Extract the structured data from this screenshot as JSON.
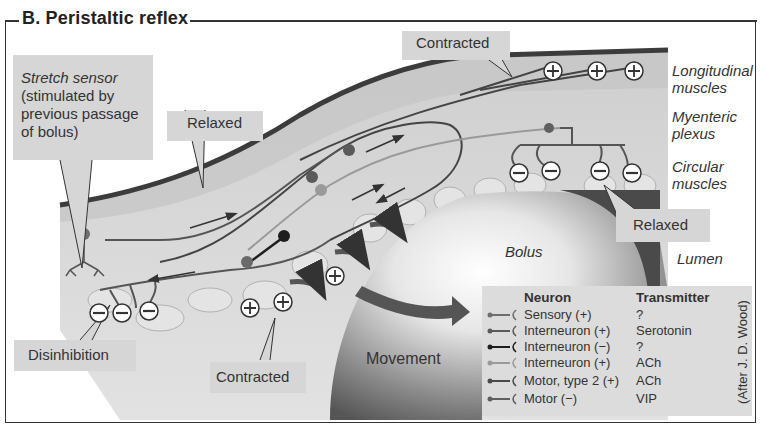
{
  "figure": {
    "title": "B.  Peristaltic reflex",
    "credit": "(After J. D. Wood)"
  },
  "callouts": {
    "stretch_sensor": {
      "line1": "Stretch sensor",
      "line2": "(stimulated by",
      "line3": "previous passage",
      "line4": "of bolus)"
    },
    "relaxed_top": "Relaxed",
    "contracted_top": "Contracted",
    "relaxed_right": "Relaxed",
    "disinhibition": "Disinhibition",
    "contracted_bottom": "Contracted"
  },
  "layers": {
    "longitudinal_1": "Longitudinal",
    "longitudinal_2": "muscles",
    "myenteric_1": "Myenteric",
    "myenteric_2": "plexus",
    "circular_1": "Circular",
    "circular_2": "muscles",
    "lumen": "Lumen"
  },
  "bolus_label": "Bolus",
  "movement_label": "Movement",
  "legend": {
    "neuron_header": "Neuron",
    "transmitter_header": "Transmitter",
    "rows": [
      {
        "neuron": "Sensory (+)",
        "transmitter": "?",
        "color": "#6e6e6e"
      },
      {
        "neuron": "Interneuron (+)",
        "transmitter": "Serotonin",
        "color": "#5a5a5a"
      },
      {
        "neuron": "Interneuron (−)",
        "transmitter": "?",
        "color": "#1e1e1e"
      },
      {
        "neuron": "Interneuron (+)",
        "transmitter": "ACh",
        "color": "#9a9a9a"
      },
      {
        "neuron": "Motor, type 2 (+)",
        "transmitter": "ACh",
        "color": "#4a4a4a"
      },
      {
        "neuron": "Motor (−)",
        "transmitter": "VIP",
        "color": "#606060"
      }
    ]
  },
  "signs": {
    "plus": "+",
    "minus": "−"
  },
  "colors": {
    "label_box": "#d6d6d6",
    "legend_bg": "#dcdcdc",
    "tissue": "#d9d9d9",
    "serosa": "#3c3c3c",
    "bolus_dark": "#4a4a4a"
  }
}
